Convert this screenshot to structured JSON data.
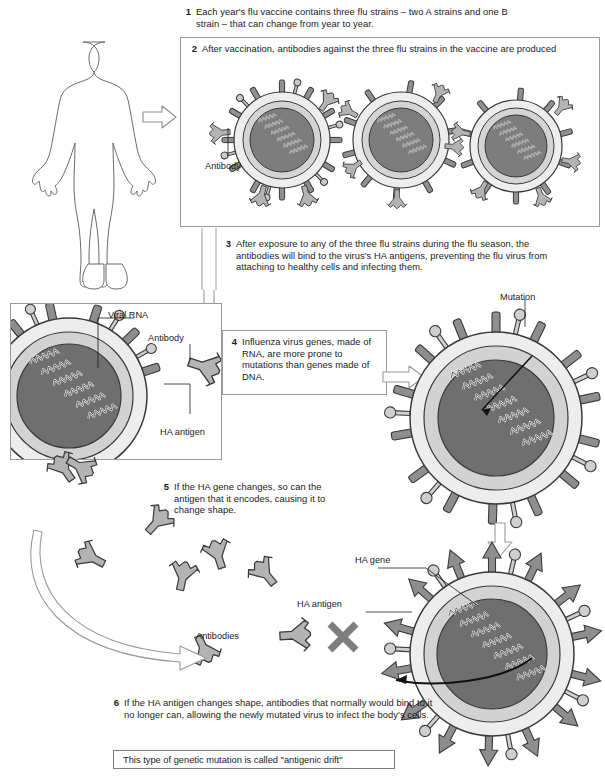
{
  "figure": {
    "title_topic": "Influenza vaccine and antigenic drift",
    "caption": "This type of genetic mutation is called \"antigenic drift\""
  },
  "steps": [
    {
      "num": "1",
      "text": "Each year's flu vaccine contains three flu strains – two A strains and one B strain – that can change from year to year."
    },
    {
      "num": "2",
      "text": "After vaccination, antibodies against the three flu strains in the vaccine are produced"
    },
    {
      "num": "3",
      "text": "After exposure to any of the three flu strains during the flu season, the antibodies will bind to the virus's HA antigens, preventing the flu virus from attaching to healthy cells and infecting them."
    },
    {
      "num": "4",
      "text": "Influenza virus genes, made of RNA, are more prone to mutations than genes made of DNA."
    },
    {
      "num": "5",
      "text": "If the HA gene changes, so can the antigen that it encodes, causing it to change shape."
    },
    {
      "num": "6",
      "text": "If the HA antigen changes shape, antibodies that normally would bind to it no longer can, allowing the newly mutated virus to infect the body's cells."
    }
  ],
  "labels": {
    "antibody_panel2": "Antibody",
    "viral_rna": "Viral RNA",
    "antibody_left": "Antibody",
    "ha_antigen_left": "HA antigen",
    "mutation": "Mutation",
    "ha_gene": "HA gene",
    "ha_antigen_bottom": "HA antigen",
    "antibodies": "Antibodies"
  },
  "icons": {
    "human": "human-body-outline",
    "arrow_right": "hollow-arrow-right",
    "arrow_down": "hollow-arrow-down",
    "arrow_curved": "hollow-curved-arrow",
    "blocked": "x-blocked-mark",
    "virus": "influenza-virus-particle",
    "antibody": "y-shaped-antibody"
  },
  "colors": {
    "core_dark": "#6e6e6e",
    "core_mid": "#8c8c8c",
    "envelope_light": "#d9d9d9",
    "envelope_pale": "#ededed",
    "spike": "#8a8a8a",
    "antibody_fill": "#b0b0b0",
    "antibody_dark": "#8a8a8a",
    "outline": "#3a3a3a",
    "panel_border": "#9a9a9a",
    "text": "#1a1a1a"
  }
}
